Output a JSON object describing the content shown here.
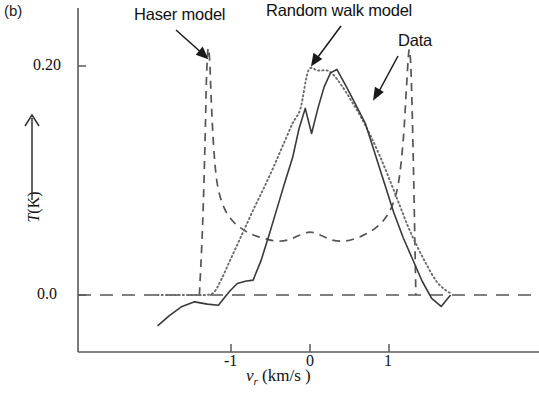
{
  "panel": {
    "label": "(b)"
  },
  "chart_data": {
    "type": "line",
    "title": "",
    "panel_label": "(b)",
    "xlabel": "v_r (km/s )",
    "xlabel_parts": {
      "symbol": "v",
      "subscript": "r",
      "unit": "(km/s )"
    },
    "ylabel": "T (K)",
    "ylabel_parts": {
      "symbol": "T",
      "unit": "(K)"
    },
    "ylabel_has_up_arrow": true,
    "xlim": [
      -1.95,
      1.85
    ],
    "ylim": [
      -0.048,
      0.238
    ],
    "xticks": [
      -1,
      0,
      1
    ],
    "xtick_labels": [
      "-1",
      "0",
      "1"
    ],
    "yticks": [
      0.0,
      0.2
    ],
    "ytick_labels": [
      "0.0",
      "0.20"
    ],
    "grid": false,
    "legend_position": "annotations",
    "zero_line": {
      "value": 0.0,
      "style": "dashed"
    },
    "series": [
      {
        "name": "Data",
        "style": "solid",
        "color": "#3a3a3a",
        "x": [
          -1.93,
          -1.78,
          -1.62,
          -1.46,
          -1.3,
          -1.16,
          -1.02,
          -0.92,
          -0.82,
          -0.72,
          -0.62,
          -0.52,
          -0.42,
          -0.32,
          -0.22,
          -0.14,
          -0.06,
          0.02,
          0.1,
          0.18,
          0.26,
          0.34,
          0.46,
          0.58,
          0.7,
          0.82,
          0.94,
          1.06,
          1.18,
          1.3,
          1.42,
          1.54,
          1.66,
          1.78
        ],
        "y": [
          -0.027,
          -0.018,
          -0.01,
          -0.006,
          -0.008,
          -0.009,
          0.003,
          0.01,
          0.012,
          0.013,
          0.03,
          0.052,
          0.075,
          0.098,
          0.12,
          0.145,
          0.163,
          0.141,
          0.163,
          0.182,
          0.194,
          0.197,
          0.182,
          0.166,
          0.15,
          0.124,
          0.098,
          0.072,
          0.05,
          0.031,
          0.012,
          -0.003,
          -0.01,
          0.0
        ]
      },
      {
        "name": "Random walk model",
        "style": "dotted",
        "color": "#6b6b6b",
        "x": [
          -1.93,
          -1.7,
          -1.5,
          -1.34,
          -1.22,
          -1.12,
          -1.02,
          -0.92,
          -0.82,
          -0.7,
          -0.58,
          -0.46,
          -0.34,
          -0.22,
          -0.12,
          -0.02,
          0.1,
          0.22,
          0.3,
          0.4,
          0.52,
          0.64,
          0.76,
          0.88,
          1.0,
          1.12,
          1.24,
          1.36,
          1.48,
          1.6,
          1.72,
          1.8
        ],
        "y": [
          0.0,
          0.0,
          0.0,
          0.0,
          0.002,
          0.014,
          0.029,
          0.044,
          0.059,
          0.077,
          0.094,
          0.112,
          0.131,
          0.15,
          0.163,
          0.196,
          0.196,
          0.196,
          0.192,
          0.183,
          0.17,
          0.156,
          0.14,
          0.122,
          0.102,
          0.081,
          0.06,
          0.042,
          0.026,
          0.012,
          0.004,
          0.001
        ]
      },
      {
        "name": "Haser model",
        "style": "dashed",
        "color": "#555555",
        "x": [
          -1.4,
          -1.36,
          -1.33,
          -1.31,
          -1.29,
          -1.27,
          -1.25,
          -1.22,
          -1.18,
          -1.12,
          -1.04,
          -0.94,
          -0.82,
          -0.7,
          -0.56,
          -0.42,
          -0.28,
          -0.14,
          0.0,
          0.14,
          0.28,
          0.42,
          0.56,
          0.7,
          0.82,
          0.94,
          1.04,
          1.12,
          1.18,
          1.22,
          1.25,
          1.27,
          1.29,
          1.31,
          1.34
        ],
        "y": [
          0.0,
          0.06,
          0.13,
          0.19,
          0.215,
          0.205,
          0.17,
          0.13,
          0.1,
          0.082,
          0.07,
          0.062,
          0.056,
          0.052,
          0.049,
          0.047,
          0.048,
          0.052,
          0.055,
          0.052,
          0.048,
          0.047,
          0.049,
          0.053,
          0.058,
          0.066,
          0.078,
          0.098,
          0.135,
          0.18,
          0.212,
          0.208,
          0.17,
          0.11,
          0.0
        ]
      }
    ],
    "annotations": [
      {
        "name": "Haser model",
        "text": "Haser model",
        "text_xy": [
          134,
          5
        ],
        "arrow_from": [
          176,
          30
        ],
        "arrow_to": [
          206,
          57
        ]
      },
      {
        "name": "Random walk model",
        "text": "Random walk model",
        "text_xy": [
          266,
          1
        ],
        "arrow_from": [
          341,
          26
        ],
        "arrow_to": [
          313,
          64
        ]
      },
      {
        "name": "Data",
        "text": "Data",
        "text_xy": [
          398,
          31
        ],
        "arrow_from": [
          398,
          56
        ],
        "arrow_to": [
          374,
          99
        ]
      }
    ]
  },
  "axes": {
    "x_title": "v",
    "x_subscript": "r",
    "x_unit": "(km/s )",
    "y_title": "T",
    "y_unit": "(K)",
    "x_tick_labels": [
      "-1",
      "0",
      "1"
    ],
    "y_tick_labels": [
      "0.20",
      "0.0"
    ]
  },
  "colors": {
    "axis": "#5a5a5a",
    "data_curve": "#3a3a3a",
    "random_walk_curve": "#6b6b6b",
    "haser_curve": "#555555",
    "text": "#111111"
  }
}
